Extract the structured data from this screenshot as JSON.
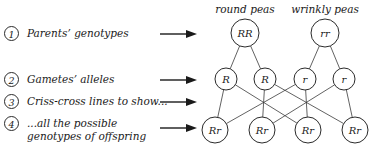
{
  "steps": [
    {
      "num": "1",
      "label": "Parents’ genotypes"
    },
    {
      "num": "2",
      "label": "Gametes’ alleles"
    },
    {
      "num": "3",
      "label": "Criss-cross lines to show..."
    },
    {
      "num": "4",
      "label": "...all the possible\ngenotypes of offspring"
    }
  ],
  "arrows": {
    "count": 4,
    "icon": "right-arrow-icon"
  },
  "chart_data": {
    "type": "diagram",
    "title": "",
    "headers": [
      {
        "text": "round peas",
        "x": 245
      },
      {
        "text": "wrinkly peas",
        "x": 325
      }
    ],
    "parents": [
      {
        "genotype": "RR",
        "x": 245,
        "y": 33,
        "r": 14
      },
      {
        "genotype": "rr",
        "x": 325,
        "y": 33,
        "r": 14
      }
    ],
    "gametes": [
      {
        "allele": "R",
        "x": 226,
        "y": 79,
        "r": 11
      },
      {
        "allele": "R",
        "x": 265,
        "y": 79,
        "r": 11
      },
      {
        "allele": "r",
        "x": 305,
        "y": 79,
        "r": 11
      },
      {
        "allele": "r",
        "x": 344,
        "y": 79,
        "r": 11
      }
    ],
    "offspring": [
      {
        "genotype": "Rr",
        "x": 215,
        "y": 130,
        "r": 13
      },
      {
        "genotype": "Rr",
        "x": 262,
        "y": 130,
        "r": 13
      },
      {
        "genotype": "Rr",
        "x": 308,
        "y": 130,
        "r": 13
      },
      {
        "genotype": "Rr",
        "x": 355,
        "y": 130,
        "r": 13
      }
    ],
    "parent_to_gamete_links": [
      {
        "from": 0,
        "to": 0
      },
      {
        "from": 0,
        "to": 1
      },
      {
        "from": 1,
        "to": 2
      },
      {
        "from": 1,
        "to": 3
      }
    ],
    "criss_cross_links": [
      {
        "gamete": 0,
        "offspring": 0
      },
      {
        "gamete": 0,
        "offspring": 2
      },
      {
        "gamete": 1,
        "offspring": 1
      },
      {
        "gamete": 1,
        "offspring": 3
      },
      {
        "gamete": 2,
        "offspring": 0
      },
      {
        "gamete": 2,
        "offspring": 2
      },
      {
        "gamete": 3,
        "offspring": 1
      },
      {
        "gamete": 3,
        "offspring": 3
      }
    ],
    "colors": {
      "stroke": "#2b2b2b",
      "link": "#3a3a3a",
      "text": "#1a1a1a",
      "background": "#ffffff"
    }
  }
}
